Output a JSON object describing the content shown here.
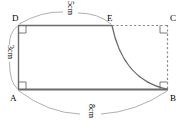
{
  "figure": {
    "stroke_color": "#6b6b6b",
    "dashed_color": "#8a8a8a",
    "text_color": "#000000",
    "background": "#ffffff",
    "vertices": [
      {
        "id": "D",
        "label": "D",
        "x": 18,
        "y": 25
      },
      {
        "id": "E",
        "label": "E",
        "x": 112,
        "y": 25
      },
      {
        "id": "C",
        "label": "C",
        "x": 168,
        "y": 25
      },
      {
        "id": "A",
        "label": "A",
        "x": 18,
        "y": 90
      },
      {
        "id": "B",
        "label": "B",
        "x": 168,
        "y": 90
      }
    ],
    "dimensions": [
      {
        "id": "top",
        "label": "5cm",
        "edge": "D-E",
        "rotated": true
      },
      {
        "id": "left",
        "label": "3cm",
        "edge": "A-D",
        "rotated": true
      },
      {
        "id": "bottom",
        "label": "8cm",
        "edge": "A-B",
        "rotated": true
      }
    ],
    "right_angle_marks": [
      {
        "id": "at-D",
        "x": 18,
        "y": 25
      },
      {
        "id": "at-A",
        "x": 18,
        "y": 90
      },
      {
        "id": "at-C",
        "x": 168,
        "y": 25
      },
      {
        "id": "at-B",
        "x": 168,
        "y": 90
      }
    ],
    "solid_edges": [
      {
        "id": "DE",
        "from": "D",
        "to": "E"
      },
      {
        "id": "DA",
        "from": "D",
        "to": "A"
      },
      {
        "id": "AB",
        "from": "A",
        "to": "B"
      }
    ],
    "dashed_edges": [
      {
        "id": "EC",
        "from": "E",
        "to": "C"
      },
      {
        "id": "CB",
        "from": "C",
        "to": "B"
      }
    ],
    "curve": {
      "id": "EB",
      "from": "E",
      "to": "B",
      "kind": "concave-quarter-curve"
    }
  }
}
